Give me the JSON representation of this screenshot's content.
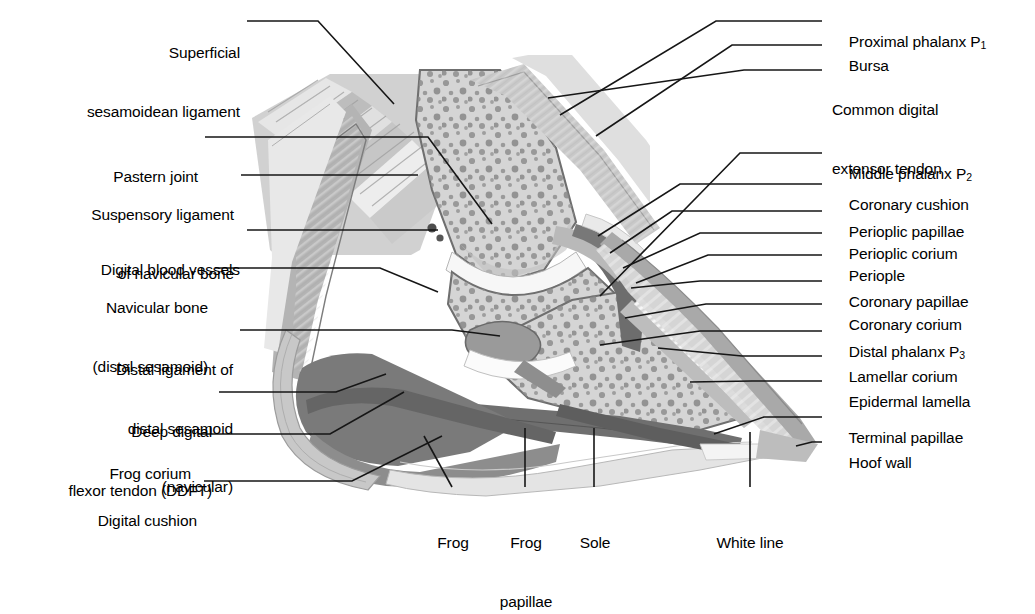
{
  "figure": {
    "style": "grayscale anatomical illustration with leader-line labels"
  },
  "colors": {
    "ink": "#000000",
    "leader_line": "#1a1a1a",
    "bone_fill": "#d2d2d2",
    "bone_outline": "#6e6e6e",
    "trabecula_dot": "#8c8c8c",
    "cartilage": "#f2f2f2",
    "tendon_light": "#e3e3e3",
    "tendon_mid": "#c4c4c4",
    "tendon_dark": "#9a9a9a",
    "corium_dark": "#6f6f6f",
    "digital_cushion": "#7a7a7a",
    "frog": "#8f8f8f",
    "hoof_wall_outer": "#a8a8a8",
    "hoof_wall_inner": "#dcdcdc",
    "lamellae": "#efefef",
    "sole": "#e7e7e7",
    "white_line": "#f6f6f6",
    "background": "#ffffff"
  },
  "labels_left": [
    {
      "id": "superficial-sesamoidean-ligament",
      "lines": [
        "Superficial",
        "sesamoidean ligament"
      ]
    },
    {
      "id": "pastern-joint",
      "lines": [
        "Pastern joint"
      ]
    },
    {
      "id": "suspensory-ligament-of-navicular-bone",
      "lines": [
        "Suspensory ligament",
        "of navicular bone"
      ]
    },
    {
      "id": "digital-blood-vessels",
      "lines": [
        "Digital blood vessels"
      ]
    },
    {
      "id": "navicular-bone",
      "lines": [
        "Navicular bone",
        "(distal sesamoid)"
      ]
    },
    {
      "id": "distal-ligament-of-distal-sesamoid",
      "lines": [
        "Distal ligament of",
        "distal sesamoid",
        "(navicular)"
      ]
    },
    {
      "id": "deep-digital-flexor-tendon",
      "lines": [
        "Deep digital",
        "flexor tendon (DDFT)"
      ]
    },
    {
      "id": "frog-corium",
      "lines": [
        "Frog corium"
      ]
    },
    {
      "id": "digital-cushion",
      "lines": [
        "Digital cushion"
      ]
    }
  ],
  "labels_right": [
    {
      "id": "proximal-phalanx-p1",
      "lines": [
        "Proximal phalanx P"
      ],
      "sub": "1"
    },
    {
      "id": "bursa",
      "lines": [
        "Bursa"
      ]
    },
    {
      "id": "common-digital-extensor-tendon",
      "lines": [
        "Common digital",
        "extensor tendon"
      ]
    },
    {
      "id": "middle-phalanx-p2",
      "lines": [
        "Middle phalanx P"
      ],
      "sub": "2"
    },
    {
      "id": "coronary-cushion",
      "lines": [
        "Coronary cushion"
      ]
    },
    {
      "id": "perioplic-papillae",
      "lines": [
        "Perioplic papillae"
      ]
    },
    {
      "id": "perioplic-corium",
      "lines": [
        "Perioplic corium"
      ]
    },
    {
      "id": "periople",
      "lines": [
        "Periople"
      ]
    },
    {
      "id": "coronary-papillae",
      "lines": [
        "Coronary papillae"
      ]
    },
    {
      "id": "coronary-corium",
      "lines": [
        "Coronary corium"
      ]
    },
    {
      "id": "distal-phalanx-p3",
      "lines": [
        "Distal phalanx P"
      ],
      "sub": "3"
    },
    {
      "id": "lamellar-corium",
      "lines": [
        "Lamellar corium"
      ]
    },
    {
      "id": "epidermal-lamella",
      "lines": [
        "Epidermal lamella"
      ]
    },
    {
      "id": "terminal-papillae",
      "lines": [
        "Terminal papillae"
      ]
    },
    {
      "id": "hoof-wall",
      "lines": [
        "Hoof wall"
      ]
    }
  ],
  "labels_bottom": [
    {
      "id": "frog",
      "lines": [
        "Frog"
      ]
    },
    {
      "id": "frog-papillae",
      "lines": [
        "Frog",
        "papillae"
      ]
    },
    {
      "id": "sole",
      "lines": [
        "Sole"
      ]
    },
    {
      "id": "white-line",
      "lines": [
        "White line"
      ]
    }
  ]
}
